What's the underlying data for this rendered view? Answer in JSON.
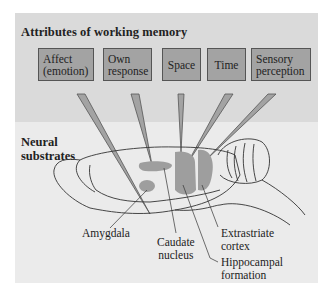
{
  "figure": {
    "title": "Attributes of working memory",
    "lower_section_label_line1": "Neural",
    "lower_section_label_line2": "substrates",
    "attributes": [
      {
        "line1": "Affect",
        "line2": "(emotion)"
      },
      {
        "line1": "Own",
        "line2": "response"
      },
      {
        "line1": "Space",
        "line2": ""
      },
      {
        "line1": "Time",
        "line2": ""
      },
      {
        "line1": "Sensory",
        "line2": "perception"
      }
    ],
    "substrates": [
      {
        "line1": "Amygdala",
        "line2": ""
      },
      {
        "line1": "Caudate",
        "line2": "nucleus"
      },
      {
        "line1": "Extrastriate",
        "line2": "cortex"
      },
      {
        "line1": "Hippocampal",
        "line2": "formation"
      }
    ],
    "colors": {
      "top_band": "#dadada",
      "lower_band": "#ebebeb",
      "box_fill": "#a3a3a3",
      "region_fill": "#9e9e9e",
      "outline": "#333333"
    }
  }
}
